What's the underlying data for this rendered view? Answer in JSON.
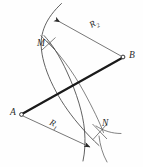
{
  "figure": {
    "type": "geometric-construction-diagram",
    "background_color": "#fefefe",
    "line_color": "#3a3a3a",
    "heavy_line_color": "#1a1a1a",
    "label_color": "#2b2b2b",
    "points": [
      {
        "id": "A",
        "label": "A",
        "x": 21,
        "y": 114,
        "marker": "small-open-circle"
      },
      {
        "id": "B",
        "label": "B",
        "x": 123,
        "y": 57,
        "marker": "small-open-circle"
      },
      {
        "id": "M",
        "label": "M",
        "x": 48,
        "y": 43,
        "marker": "arc-intersection"
      },
      {
        "id": "N",
        "label": "N",
        "x": 100,
        "y": 131,
        "marker": "arc-intersection"
      }
    ],
    "radii": [
      {
        "id": "R1",
        "label": "R",
        "subscript": "1",
        "from": "A",
        "to": "N",
        "arrow": "double-ended"
      },
      {
        "id": "R2",
        "label": "R",
        "subscript": "2",
        "from": "B",
        "to": "M",
        "arrow": "double-ended"
      }
    ],
    "segments": [
      {
        "id": "AB",
        "from": "A",
        "to": "B",
        "style": "heavy"
      }
    ],
    "arcs": [
      {
        "id": "arc-A",
        "center": "A",
        "through": [
          "M",
          "N"
        ],
        "bulge": "right"
      },
      {
        "id": "arc-B",
        "center": "B",
        "through": [
          "M",
          "N"
        ],
        "bulge": "left"
      }
    ]
  }
}
